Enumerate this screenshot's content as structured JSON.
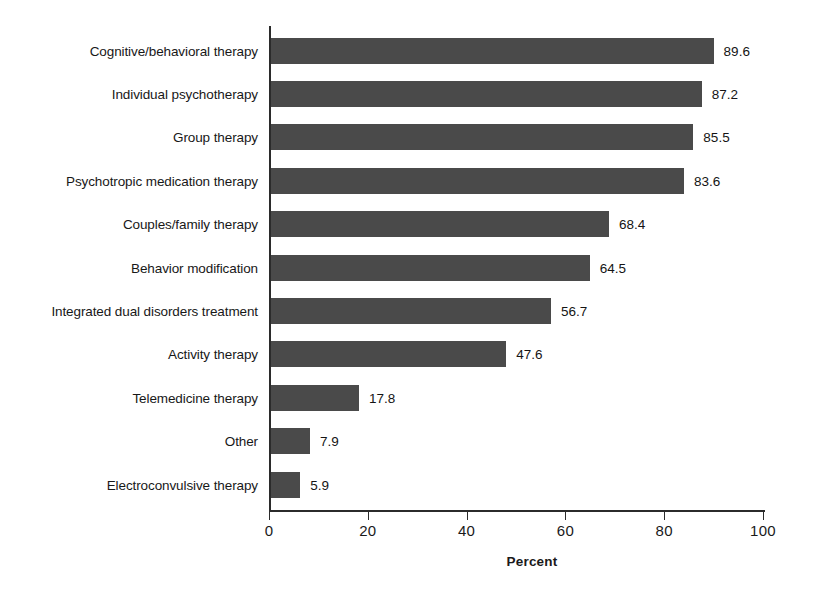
{
  "chart_data": {
    "type": "bar",
    "orientation": "horizontal",
    "title": "",
    "xlabel": "Percent",
    "ylabel": "",
    "xlim": [
      0,
      100
    ],
    "xticks": [
      0,
      20,
      40,
      60,
      80,
      100
    ],
    "grid": false,
    "legend": false,
    "bar_color": "#4a4a4a",
    "categories": [
      "Cognitive/behavioral therapy",
      "Individual psychotherapy",
      "Group therapy",
      "Psychotropic medication therapy",
      "Couples/family therapy",
      "Behavior modification",
      "Integrated dual disorders treatment",
      "Activity therapy",
      "Telemedicine therapy",
      "Other",
      "Electroconvulsive therapy"
    ],
    "values": [
      89.6,
      87.2,
      85.5,
      83.6,
      68.4,
      64.5,
      56.7,
      47.6,
      17.8,
      7.9,
      5.9
    ],
    "value_labels": [
      "89.6",
      "87.2",
      "85.5",
      "83.6",
      "68.4",
      "64.5",
      "56.7",
      "47.6",
      "17.8",
      "7.9",
      "5.9"
    ],
    "tick_labels": [
      "0",
      "20",
      "40",
      "60",
      "80",
      "100"
    ]
  }
}
